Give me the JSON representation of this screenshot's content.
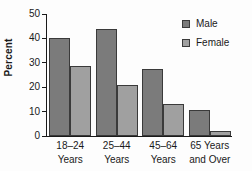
{
  "chart_data": {
    "type": "bar",
    "title": "",
    "xlabel": "",
    "ylabel": "Percent",
    "ylim": [
      0,
      50
    ],
    "yticks": [
      0,
      10,
      20,
      30,
      40,
      50
    ],
    "grid": false,
    "legend_position": "top-right",
    "categories": [
      "18–24 Years",
      "25–44 Years",
      "45–64 Years",
      "65 Years and Over"
    ],
    "category_lines": [
      {
        "line1": "18–24",
        "line2": "Years"
      },
      {
        "line1": "25–44",
        "line2": "Years"
      },
      {
        "line1": "45–64",
        "line2": "Years"
      },
      {
        "line1": "65 Years",
        "line2": "and Over"
      }
    ],
    "series": [
      {
        "name": "Male",
        "color": "#7b7b7b",
        "values": [
          40.0,
          44.0,
          27.5,
          10.5
        ]
      },
      {
        "name": "Female",
        "color": "#a0a0a0",
        "values": [
          28.7,
          21.0,
          13.0,
          2.0
        ]
      }
    ]
  },
  "legend": {
    "items": [
      {
        "label": "Male",
        "swatch": "male"
      },
      {
        "label": "Female",
        "swatch": "female"
      }
    ]
  },
  "axis": {
    "y_label": "Percent",
    "y_tick_labels": [
      "50",
      "40",
      "30",
      "20",
      "10",
      "0"
    ]
  }
}
